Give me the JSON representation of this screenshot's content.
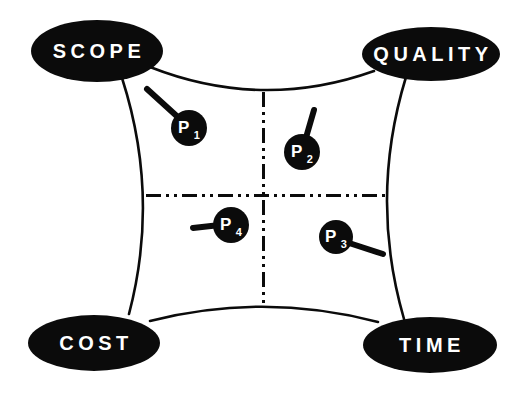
{
  "colors": {
    "background": "#ffffff",
    "ink": "#0b0b0b",
    "label_text": "#ffffff"
  },
  "diagram": {
    "corners": [
      {
        "id": "scope",
        "label": "SCOPE"
      },
      {
        "id": "quality",
        "label": "QUALITY"
      },
      {
        "id": "cost",
        "label": "COST"
      },
      {
        "id": "time",
        "label": "TIME"
      }
    ],
    "points": [
      {
        "id": "p1",
        "label": "P",
        "subscript": "1"
      },
      {
        "id": "p2",
        "label": "P",
        "subscript": "2"
      },
      {
        "id": "p3",
        "label": "P",
        "subscript": "3"
      },
      {
        "id": "p4",
        "label": "P",
        "subscript": "4"
      }
    ]
  }
}
